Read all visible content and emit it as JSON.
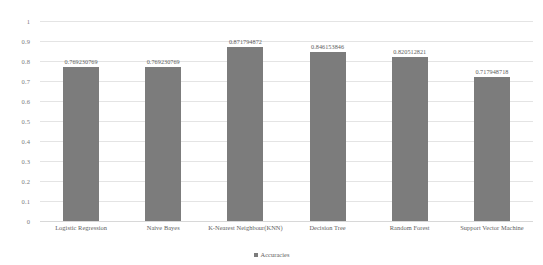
{
  "chart_data": {
    "type": "bar",
    "title": "",
    "xlabel": "",
    "ylabel": "",
    "ylim": [
      0,
      1
    ],
    "ytick_labels": [
      "1",
      "0.9",
      "0.8",
      "0.7",
      "0.6",
      "0.5",
      "0.4",
      "0.3",
      "0.2",
      "0.1",
      "0"
    ],
    "ytick_values": [
      1,
      0.9,
      0.8,
      0.7,
      0.6,
      0.5,
      0.4,
      0.3,
      0.2,
      0.1,
      0
    ],
    "grid": true,
    "legend_position": "bottom",
    "categories": [
      "Logistic Regression",
      "Naive Bayes",
      "K-Nearest Neighbour(KNN)",
      "Decision Tree",
      "Random Forest",
      "Support Vector Machine"
    ],
    "series": [
      {
        "name": "Accuracies",
        "color": "#7c7c7c",
        "values": [
          0.769230769,
          0.769230769,
          0.871794872,
          0.846153846,
          0.820512821,
          0.717948718
        ],
        "data_labels": [
          "0.769230769",
          "0.769230769",
          "0.871794872",
          "0.846153846",
          "0.820512821",
          "0.717948718"
        ]
      }
    ]
  },
  "legend": {
    "marker": "square-marker-icon",
    "label": "Accuracies"
  },
  "colors": {
    "bar": "#7c7c7c",
    "gridline": "#e4e4e4",
    "tick_text": "#7b7b7b",
    "label_text": "#5e5e5e",
    "background": "#ffffff"
  }
}
